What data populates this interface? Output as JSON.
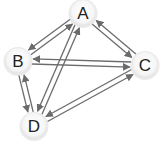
{
  "diagram": {
    "type": "directed-graph",
    "edge_color": "#6b6b6b",
    "node_fill": "#f4f4f4",
    "node_shadow": "#dcdcdc",
    "label_color": "#222222",
    "nodes": [
      {
        "id": "A",
        "label": "A",
        "x": 83,
        "y": 13
      },
      {
        "id": "B",
        "label": "B",
        "x": 18,
        "y": 61
      },
      {
        "id": "C",
        "label": "C",
        "x": 145,
        "y": 65
      },
      {
        "id": "D",
        "label": "D",
        "x": 34,
        "y": 126
      }
    ],
    "edges": [
      {
        "from": "B",
        "to": "A"
      },
      {
        "from": "A",
        "to": "B"
      },
      {
        "from": "C",
        "to": "A"
      },
      {
        "from": "A",
        "to": "C"
      },
      {
        "from": "B",
        "to": "C"
      },
      {
        "from": "C",
        "to": "B"
      },
      {
        "from": "D",
        "to": "B"
      },
      {
        "from": "B",
        "to": "D"
      },
      {
        "from": "A",
        "to": "D"
      },
      {
        "from": "D",
        "to": "A"
      },
      {
        "from": "D",
        "to": "C"
      },
      {
        "from": "C",
        "to": "D"
      }
    ]
  }
}
